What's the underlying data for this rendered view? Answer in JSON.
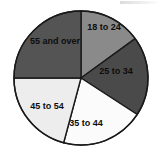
{
  "chart_data": {
    "type": "pie",
    "title": "",
    "subtitle": "",
    "xlabel": "",
    "ylabel": "",
    "legend_position": "none",
    "labels_position": "inside-slices",
    "grid": false,
    "start_angle_deg": 0,
    "direction": "clockwise",
    "categories": [
      "18 to 24",
      "25 to 34",
      "35 to 44",
      "45 to 54",
      "55 and over"
    ],
    "values": [
      15,
      19,
      20,
      21,
      25
    ],
    "slice_angles_deg": [
      54,
      69,
      72,
      75,
      90
    ],
    "slice_start_deg": [
      0,
      54,
      123,
      195,
      270
    ],
    "slice_end_deg": [
      54,
      123,
      195,
      270,
      360
    ],
    "colors": [
      "#8a8a8a",
      "#4a4a4a",
      "#fbfbfb",
      "#ededed",
      "#545454"
    ],
    "slices": [
      {
        "label": "18 to 24",
        "value": 15,
        "angle_deg": 54,
        "start_deg": 0,
        "end_deg": 54,
        "color": "#8a8a8a",
        "label_color": "#0d0d0d"
      },
      {
        "label": "25 to 34",
        "value": 19,
        "angle_deg": 69,
        "start_deg": 54,
        "end_deg": 123,
        "color": "#4a4a4a",
        "label_color": "#0d0d0d"
      },
      {
        "label": "35 to 44",
        "value": 20,
        "angle_deg": 72,
        "start_deg": 123,
        "end_deg": 195,
        "color": "#fbfbfb",
        "label_color": "#0d0d0d"
      },
      {
        "label": "45 to 54",
        "value": 21,
        "angle_deg": 75,
        "start_deg": 195,
        "end_deg": 270,
        "color": "#ededed",
        "label_color": "#0d0d0d"
      },
      {
        "label": "55 and over",
        "value": 25,
        "angle_deg": 90,
        "start_deg": 270,
        "end_deg": 360,
        "color": "#545454",
        "label_color": "#0d0d0d"
      }
    ],
    "geometry": {
      "cx": 81,
      "cy": 78,
      "r": 67
    },
    "outline_color": "#1a1a1a"
  },
  "chart": {
    "slice_1_label": "18 to 24",
    "slice_2_label": "25 to 34",
    "slice_3_label": "35 to 44",
    "slice_4_label": "45 to 54",
    "slice_5_label": "55 and over"
  }
}
